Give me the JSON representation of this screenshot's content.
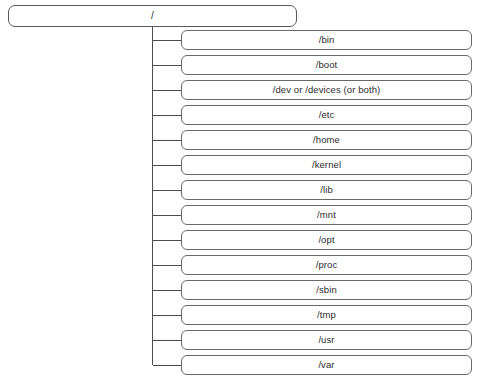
{
  "diagram": {
    "type": "tree",
    "title_visible": false,
    "colors": {
      "background": "#ffffff",
      "node_border": "#595959",
      "child_border": "#6a6a6a",
      "connector": "#4d4d4d",
      "text": "#2b2b2b"
    },
    "root": {
      "label": "/"
    },
    "children": [
      {
        "label": "/bin"
      },
      {
        "label": "/boot"
      },
      {
        "label": "/dev or /devices (or both)"
      },
      {
        "label": "/etc"
      },
      {
        "label": "/home"
      },
      {
        "label": "/kernel"
      },
      {
        "label": "/lib"
      },
      {
        "label": "/mnt"
      },
      {
        "label": "/opt"
      },
      {
        "label": "/proc"
      },
      {
        "label": "/sbin"
      },
      {
        "label": "/tmp"
      },
      {
        "label": "/usr"
      },
      {
        "label": "/var"
      }
    ]
  }
}
